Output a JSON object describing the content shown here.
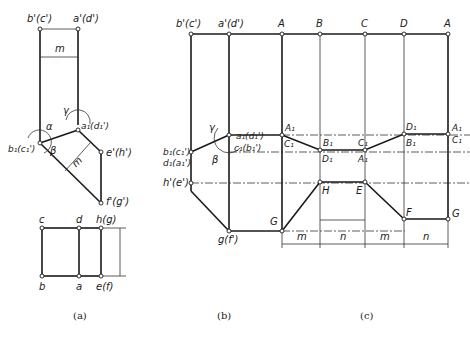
{
  "figure": {
    "captions": {
      "a": "(a)",
      "b": "(b)",
      "c": "(c)"
    },
    "view_a": {
      "front_labels": {
        "b_prime": "b'(c')",
        "a_prime": "a'(d')",
        "a1": "a₁(d₁')",
        "b1": "b₁(c₁')",
        "e_prime": "e'(h')",
        "f_prime": "f'(g')",
        "m_top": "m",
        "m_diag": "m",
        "alpha": "α",
        "beta": "β",
        "gamma": "γ"
      },
      "top_labels": {
        "c": "c",
        "d": "d",
        "hg": "h(g)",
        "b": "b",
        "a": "a",
        "ef": "e(f)"
      }
    },
    "view_b": {
      "labels": {
        "b_prime": "b'(c')",
        "a_prime": "a'(d')",
        "a1": "a₁(d₁')",
        "c1": "c₁(b₁')",
        "b1": "b₁(c₁')",
        "d1": "d₁(a₁')",
        "h_prime": "h'(e')",
        "g": "g(f')",
        "beta": "β",
        "gamma": "γ"
      }
    },
    "view_c": {
      "top_labels": [
        "A",
        "B",
        "C",
        "D",
        "A"
      ],
      "row1_upper": [
        "A₁",
        "B₁",
        "C₁",
        "D₁",
        "A₁"
      ],
      "row1_lower": [
        "C₁",
        "D₁",
        "A₁",
        "B₁",
        "C₁"
      ],
      "bottom_labels": {
        "G1": "G",
        "H": "H",
        "E": "E",
        "F": "F",
        "G2": "G"
      },
      "dimensions": [
        "m",
        "n",
        "m",
        "n"
      ]
    }
  }
}
